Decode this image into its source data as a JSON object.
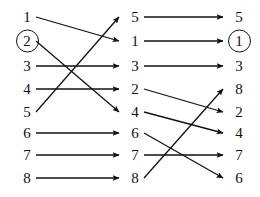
{
  "diagram": {
    "type": "permutation-network",
    "title": "",
    "columns": [
      {
        "name": "left",
        "x": 10,
        "labels": [
          "1",
          "2",
          "3",
          "4",
          "5",
          "6",
          "7",
          "8"
        ],
        "circled": [
          1
        ]
      },
      {
        "name": "middle",
        "x": 118,
        "labels": [
          "5",
          "1",
          "3",
          "2",
          "4",
          "6",
          "7",
          "8"
        ],
        "circled": []
      },
      {
        "name": "right",
        "x": 222,
        "labels": [
          "5",
          "1",
          "3",
          "8",
          "2",
          "4",
          "7",
          "6"
        ],
        "circled": [
          1
        ]
      }
    ],
    "rows_y": [
      17,
      41,
      66,
      89,
      112,
      133,
      155,
      178
    ],
    "edges_left": [
      {
        "from": 0,
        "to": 1
      },
      {
        "from": 1,
        "to": 4
      },
      {
        "from": 2,
        "to": 2
      },
      {
        "from": 3,
        "to": 3
      },
      {
        "from": 4,
        "to": 0
      },
      {
        "from": 5,
        "to": 5
      },
      {
        "from": 6,
        "to": 6
      },
      {
        "from": 7,
        "to": 7
      }
    ],
    "edges_right": [
      {
        "from": 0,
        "to": 0
      },
      {
        "from": 1,
        "to": 1
      },
      {
        "from": 2,
        "to": 2
      },
      {
        "from": 3,
        "to": 4
      },
      {
        "from": 4,
        "to": 5
      },
      {
        "from": 5,
        "to": 7
      },
      {
        "from": 6,
        "to": 6
      },
      {
        "from": 7,
        "to": 3
      }
    ],
    "style": {
      "line_color": "#111111",
      "background": "#ffffff",
      "line_width": 1.3
    }
  }
}
